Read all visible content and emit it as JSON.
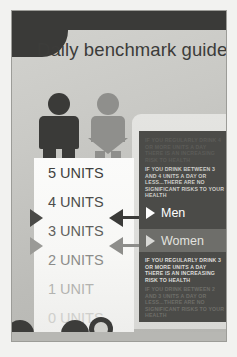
{
  "poster": {
    "title": "Daily benchmark guide"
  },
  "figures": [
    {
      "name": "male-figure",
      "gender": "male",
      "color": "#3a3a38"
    },
    {
      "name": "female-figure",
      "gender": "female",
      "color": "#8f8f8c"
    }
  ],
  "units_scale": {
    "items": [
      {
        "label": "5 UNITS",
        "color": "#3f3f3d"
      },
      {
        "label": "4 UNITS",
        "color": "#4c4c4a"
      },
      {
        "label": "3 UNITS",
        "color": "#5f5f5c"
      },
      {
        "label": "2 UNITS",
        "color": "#8c8c89"
      },
      {
        "label": "1 UNIT",
        "color": "#b3b3b0"
      },
      {
        "label": "0 UNITS",
        "color": "#cfcfcc"
      }
    ]
  },
  "markers": {
    "men": {
      "name": "men-marker",
      "color": "#3a3a38"
    },
    "women": {
      "name": "women-marker",
      "color": "#8d8d8a"
    }
  },
  "info_panel": {
    "paragraph_top_faded": "IF YOU REGULARLY DRINK 4 OR MORE UNITS A DAY THERE IS AN INCREASING RISK TO HEALTH",
    "paragraph_men": "IF YOU DRINK BETWEEN 3 AND 4 UNITS A DAY OR LESS...THERE ARE NO SIGNIFICANT RISKS TO YOUR HEALTH",
    "men_label": "Men",
    "women_label": "Women",
    "paragraph_women_risk": "IF YOU REGULARLY DRINK 3 OR MORE UNITS A DAY THERE IS AN INCREASING RISK TO HEALTH",
    "paragraph_women_safe": "IF YOU DRINK BETWEEN 2 AND 3 UNITS A DAY OR LESS...THERE ARE NO SIGNIFICANT RISKS TO YOUR HEALTH"
  },
  "colors": {
    "dark": "#3a3a38",
    "panel_dark": "#4b4b48",
    "panel_mid": "#6e6e6a",
    "background": "#c9c9c5"
  }
}
